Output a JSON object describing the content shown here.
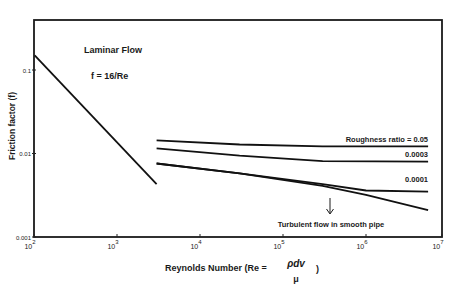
{
  "chart_data": {
    "type": "line",
    "title": "",
    "xlabel": "Reynolds Number (Re = ρdv/μ)",
    "xlabel_prefix": "Reynolds Number (Re = ",
    "xlabel_numerator": "ρdv",
    "xlabel_denominator": "μ",
    "xlabel_suffix": ")",
    "ylabel": "Friction factor (f)",
    "xscale": "log",
    "yscale": "log",
    "xlim": [
      100,
      10000000
    ],
    "ylim": [
      0.001,
      0.2
    ],
    "grid": false,
    "x_ticks": [
      {
        "value": 100,
        "base": "10",
        "exp": "2"
      },
      {
        "value": 1000,
        "base": "10",
        "exp": "3"
      },
      {
        "value": 10000,
        "base": "10",
        "exp": "4"
      },
      {
        "value": 100000,
        "base": "10",
        "exp": "5"
      },
      {
        "value": 1000000,
        "base": "10",
        "exp": "6"
      },
      {
        "value": 10000000,
        "base": "10",
        "exp": "7"
      }
    ],
    "y_ticks": [
      {
        "value": 0.1,
        "label": "0.1"
      },
      {
        "value": 0.01,
        "label": "0.01"
      },
      {
        "value": 0.001,
        "label": "0.001"
      }
    ],
    "annotations": {
      "laminar_title": "Laminar Flow",
      "laminar_formula": "f = 16/Re",
      "smooth_pipe": "Turbulent flow in smooth pipe"
    },
    "series": [
      {
        "name": "Laminar (f = 16/Re)",
        "label": "",
        "x": [
          102,
          3000
        ],
        "y": [
          0.15,
          0.0043
        ]
      },
      {
        "name": "Roughness ratio = 0.05",
        "label": "Roughness ratio = 0.05",
        "x": [
          3000,
          30000,
          300000,
          5600000
        ],
        "y": [
          0.0144,
          0.0128,
          0.0122,
          0.0122
        ]
      },
      {
        "name": "Roughness ratio = 0.0003",
        "label": "0.0003",
        "x": [
          3000,
          30000,
          300000,
          5600000
        ],
        "y": [
          0.0115,
          0.0094,
          0.0081,
          0.008
        ]
      },
      {
        "name": "Roughness ratio = 0.0001",
        "label": "0.0001",
        "x": [
          3000,
          30000,
          300000,
          1000000,
          5600000
        ],
        "y": [
          0.0076,
          0.0058,
          0.0043,
          0.0036,
          0.0035
        ]
      },
      {
        "name": "Turbulent flow in smooth pipe",
        "label": "",
        "x": [
          3000,
          30000,
          300000,
          1000000,
          5600000
        ],
        "y": [
          0.0076,
          0.0058,
          0.0041,
          0.0032,
          0.0021
        ]
      }
    ]
  }
}
